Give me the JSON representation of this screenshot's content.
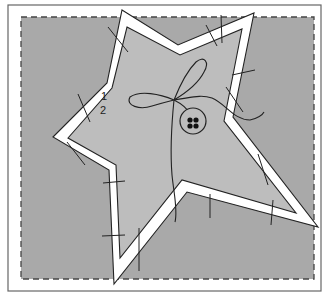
{
  "diagram": {
    "labels": [
      {
        "text": "1",
        "x": 101,
        "y": 91
      },
      {
        "text": "2",
        "x": 100,
        "y": 105
      }
    ],
    "colors": {
      "frame": "#ffffff",
      "frame_border": "#555555",
      "background_fabric": "#a9a9a9",
      "star_fabric": "#bdbdbd",
      "seam_allowance": "#ffffff",
      "stitch_lines": "#222222",
      "dashed_border": "#444444"
    },
    "elements": [
      "outer-frame",
      "dashed-cut-line",
      "star-shape-with-seam-allowance",
      "pin-marks",
      "bow-thread",
      "button"
    ]
  }
}
